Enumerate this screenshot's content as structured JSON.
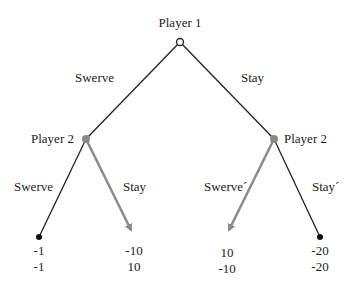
{
  "colors": {
    "line": "#222222",
    "highlight": "#8a8a8a",
    "node_root": "#ffffff"
  },
  "root": {
    "label": "Player 1"
  },
  "branches_p1": [
    {
      "label": "Swerve"
    },
    {
      "label": "Stay"
    }
  ],
  "nodes_p2": [
    {
      "label": "Player 2",
      "branches": [
        {
          "label": "Swerve",
          "highlight": false
        },
        {
          "label": "Stay",
          "highlight": true
        }
      ]
    },
    {
      "label": "Player 2",
      "branches": [
        {
          "label": "Swerve´",
          "highlight": true
        },
        {
          "label": "Stay´",
          "highlight": false
        }
      ]
    }
  ],
  "payoffs": [
    {
      "p1": "-1",
      "p2": "-1"
    },
    {
      "p1": "-10",
      "p2": "10"
    },
    {
      "p1": "10",
      "p2": "-10"
    },
    {
      "p1": "-20",
      "p2": "-20"
    }
  ]
}
